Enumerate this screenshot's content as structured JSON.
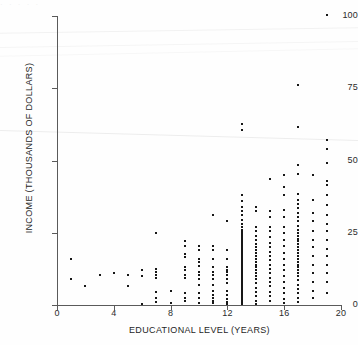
{
  "figure": {
    "background_color": "#fefefe",
    "point_color": "#171717",
    "axis_color": "#5a5a5a",
    "top_artifact_text": "·  ·    ·   ·  ·"
  },
  "chart_data": {
    "type": "scatter",
    "title": "",
    "xlabel": "EDUCATIONAL LEVEL (YEARS)",
    "ylabel": "INCOME (THOUSANDS OF DOLLARS)",
    "xlim": [
      0,
      20
    ],
    "ylim": [
      0,
      100
    ],
    "xticks": [
      0,
      4,
      8,
      12,
      16,
      20
    ],
    "yticks": [
      0,
      25,
      50,
      75,
      100
    ],
    "xtick_labels": [
      "0",
      "4",
      "8",
      "12",
      "16",
      "20"
    ],
    "ytick_labels": [
      "0",
      "25",
      "50",
      "75",
      "100"
    ],
    "grid": false,
    "legend": null,
    "marker": "dot",
    "points": [
      [
        1,
        16
      ],
      [
        1,
        9
      ],
      [
        2,
        6.5
      ],
      [
        3,
        10.5
      ],
      [
        4,
        11
      ],
      [
        5,
        10.5
      ],
      [
        5,
        6.5
      ],
      [
        6,
        12
      ],
      [
        6,
        10
      ],
      [
        6,
        0.3
      ],
      [
        7,
        25
      ],
      [
        7,
        12.5
      ],
      [
        7,
        11.5
      ],
      [
        7,
        10.5
      ],
      [
        7,
        9.5
      ],
      [
        7,
        4.5
      ],
      [
        7,
        2.5
      ],
      [
        7,
        1.2
      ],
      [
        8,
        5
      ],
      [
        8,
        0.8
      ],
      [
        9,
        22
      ],
      [
        9,
        20.5
      ],
      [
        9,
        17.5
      ],
      [
        9,
        16.5
      ],
      [
        9,
        13
      ],
      [
        9,
        12
      ],
      [
        9,
        10.5
      ],
      [
        9,
        9.5
      ],
      [
        9,
        4
      ],
      [
        9,
        2.5
      ],
      [
        9,
        1.5
      ],
      [
        10,
        20.5
      ],
      [
        10,
        19
      ],
      [
        10,
        16
      ],
      [
        10,
        15
      ],
      [
        10,
        13.5
      ],
      [
        10,
        11.5
      ],
      [
        10,
        10.5
      ],
      [
        10,
        9
      ],
      [
        10,
        7
      ],
      [
        10,
        4
      ],
      [
        10,
        2.5
      ],
      [
        10,
        0.8
      ],
      [
        11,
        31
      ],
      [
        11,
        20.5
      ],
      [
        11,
        19
      ],
      [
        11,
        16
      ],
      [
        11,
        13
      ],
      [
        11,
        11.5
      ],
      [
        11,
        10.5
      ],
      [
        11,
        9
      ],
      [
        11,
        7
      ],
      [
        11,
        5
      ],
      [
        11,
        3.5
      ],
      [
        11,
        2.5
      ],
      [
        11,
        1.5
      ],
      [
        11,
        0.6
      ],
      [
        12,
        29
      ],
      [
        12,
        19
      ],
      [
        12,
        16
      ],
      [
        12,
        13
      ],
      [
        12,
        12
      ],
      [
        12,
        11.5
      ],
      [
        12,
        10.5
      ],
      [
        12,
        9
      ],
      [
        12,
        7.5
      ],
      [
        12,
        5
      ],
      [
        12,
        3.5
      ],
      [
        12,
        2.2
      ],
      [
        12,
        1.2
      ],
      [
        12,
        0.5
      ],
      [
        13,
        62.5
      ],
      [
        13,
        60.5
      ],
      [
        13,
        38
      ],
      [
        13,
        36
      ],
      [
        13,
        34
      ],
      [
        13,
        32.5
      ],
      [
        13,
        31
      ],
      [
        13,
        29.5
      ],
      [
        13,
        28
      ],
      [
        13,
        27
      ],
      [
        13,
        26
      ],
      [
        13,
        25.5
      ],
      [
        13,
        25
      ],
      [
        13,
        24.5
      ],
      [
        13,
        24
      ],
      [
        13,
        23.5
      ],
      [
        13,
        23
      ],
      [
        13,
        22.5
      ],
      [
        13,
        22
      ],
      [
        13,
        21.5
      ],
      [
        13,
        21
      ],
      [
        13,
        20.5
      ],
      [
        13,
        20
      ],
      [
        13,
        19.5
      ],
      [
        13,
        19
      ],
      [
        13,
        18.5
      ],
      [
        13,
        18
      ],
      [
        13,
        17.5
      ],
      [
        13,
        17
      ],
      [
        13,
        16.5
      ],
      [
        13,
        16
      ],
      [
        13,
        15.5
      ],
      [
        13,
        15
      ],
      [
        13,
        14.5
      ],
      [
        13,
        14
      ],
      [
        13,
        13.5
      ],
      [
        13,
        13
      ],
      [
        13,
        12.5
      ],
      [
        13,
        12
      ],
      [
        13,
        11.5
      ],
      [
        13,
        11
      ],
      [
        13,
        10.5
      ],
      [
        13,
        10
      ],
      [
        13,
        9.5
      ],
      [
        13,
        9
      ],
      [
        13,
        8.5
      ],
      [
        13,
        8
      ],
      [
        13,
        7.5
      ],
      [
        13,
        7
      ],
      [
        13,
        6.5
      ],
      [
        13,
        6
      ],
      [
        13,
        5.5
      ],
      [
        13,
        5
      ],
      [
        13,
        4.5
      ],
      [
        13,
        4
      ],
      [
        13,
        3.5
      ],
      [
        13,
        3
      ],
      [
        13,
        2.5
      ],
      [
        13,
        2
      ],
      [
        13,
        1.5
      ],
      [
        13,
        1
      ],
      [
        13,
        0.5
      ],
      [
        14,
        34
      ],
      [
        14,
        32.5
      ],
      [
        14,
        27
      ],
      [
        14,
        25.5
      ],
      [
        14,
        24
      ],
      [
        14,
        22.5
      ],
      [
        14,
        21
      ],
      [
        14,
        20
      ],
      [
        14,
        19
      ],
      [
        14,
        18
      ],
      [
        14,
        17
      ],
      [
        14,
        16
      ],
      [
        14,
        15
      ],
      [
        14,
        14
      ],
      [
        14,
        13
      ],
      [
        14,
        12
      ],
      [
        14,
        11
      ],
      [
        14,
        10
      ],
      [
        14,
        9
      ],
      [
        14,
        7.5
      ],
      [
        14,
        6
      ],
      [
        14,
        4.5
      ],
      [
        14,
        3
      ],
      [
        14,
        1.5
      ],
      [
        14,
        0.5
      ],
      [
        15,
        43.5
      ],
      [
        15,
        32.5
      ],
      [
        15,
        30.5
      ],
      [
        15,
        27
      ],
      [
        15,
        25.5
      ],
      [
        15,
        23.5
      ],
      [
        15,
        21.5
      ],
      [
        15,
        20
      ],
      [
        15,
        18.5
      ],
      [
        15,
        17
      ],
      [
        15,
        15.5
      ],
      [
        15,
        14
      ],
      [
        15,
        12.5
      ],
      [
        15,
        11
      ],
      [
        15,
        9.5
      ],
      [
        15,
        8
      ],
      [
        15,
        6.5
      ],
      [
        15,
        4.5
      ],
      [
        15,
        3
      ],
      [
        15,
        1.5
      ],
      [
        16,
        45
      ],
      [
        16,
        41
      ],
      [
        16,
        38
      ],
      [
        16,
        33
      ],
      [
        16,
        30.5
      ],
      [
        16,
        27
      ],
      [
        16,
        25
      ],
      [
        16,
        22.5
      ],
      [
        16,
        20.5
      ],
      [
        16,
        18
      ],
      [
        16,
        16
      ],
      [
        16,
        14
      ],
      [
        16,
        12
      ],
      [
        16,
        10
      ],
      [
        16,
        8
      ],
      [
        16,
        6
      ],
      [
        16,
        4
      ],
      [
        16,
        2
      ],
      [
        16,
        0.8
      ],
      [
        17,
        76
      ],
      [
        17,
        61.5
      ],
      [
        17,
        48.5
      ],
      [
        17,
        45.5
      ],
      [
        17,
        38.5
      ],
      [
        17,
        36.5
      ],
      [
        17,
        35
      ],
      [
        17,
        33.5
      ],
      [
        17,
        32
      ],
      [
        17,
        30.5
      ],
      [
        17,
        29
      ],
      [
        17,
        27.5
      ],
      [
        17,
        26
      ],
      [
        17,
        25
      ],
      [
        17,
        24
      ],
      [
        17,
        23
      ],
      [
        17,
        22
      ],
      [
        17,
        21
      ],
      [
        17,
        20
      ],
      [
        17,
        19
      ],
      [
        17,
        18
      ],
      [
        17,
        17
      ],
      [
        17,
        16
      ],
      [
        17,
        15
      ],
      [
        17,
        14
      ],
      [
        17,
        13
      ],
      [
        17,
        12
      ],
      [
        17,
        11
      ],
      [
        17,
        10
      ],
      [
        17,
        8.5
      ],
      [
        17,
        7
      ],
      [
        17,
        5.5
      ],
      [
        17,
        4
      ],
      [
        17,
        2.5
      ],
      [
        17,
        1
      ],
      [
        18,
        45
      ],
      [
        18,
        36.5
      ],
      [
        18,
        32
      ],
      [
        18,
        29
      ],
      [
        18,
        25.5
      ],
      [
        18,
        22.5
      ],
      [
        18,
        20
      ],
      [
        18,
        17
      ],
      [
        18,
        14
      ],
      [
        18,
        11
      ],
      [
        18,
        8
      ],
      [
        18,
        5
      ],
      [
        18,
        2.5
      ],
      [
        19,
        100.5
      ],
      [
        19,
        57
      ],
      [
        19,
        54
      ],
      [
        19,
        49
      ],
      [
        19,
        43
      ],
      [
        19,
        41.5
      ],
      [
        19,
        38
      ],
      [
        19,
        34.5
      ],
      [
        19,
        31
      ],
      [
        19,
        28
      ],
      [
        19,
        25.5
      ],
      [
        19,
        22.5
      ],
      [
        19,
        19.5
      ],
      [
        19,
        17
      ],
      [
        19,
        14
      ],
      [
        19,
        11
      ],
      [
        19,
        8
      ],
      [
        19,
        4
      ]
    ]
  }
}
